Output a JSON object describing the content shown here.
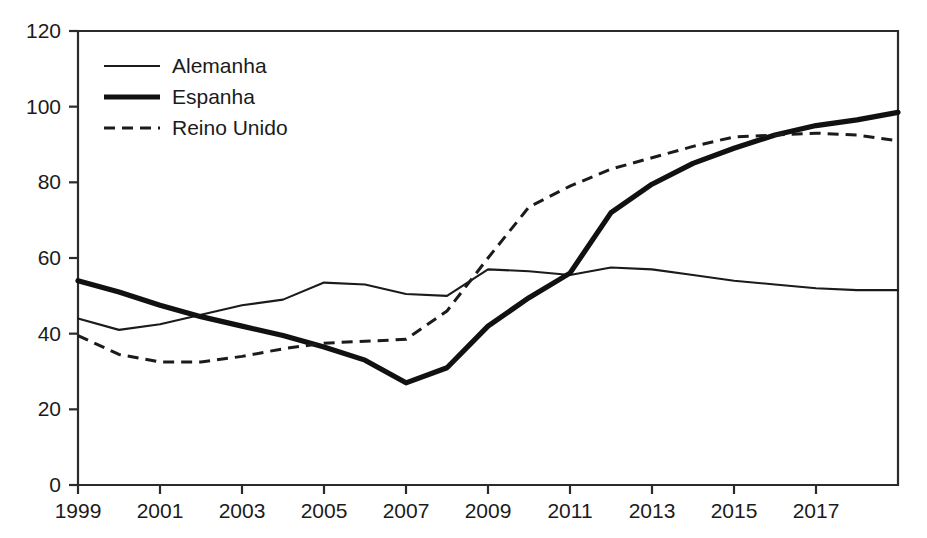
{
  "chart_data": {
    "type": "line",
    "title": "",
    "subtitle": "",
    "xlabel": "",
    "ylabel": "",
    "xlim": [
      1999,
      2019
    ],
    "ylim": [
      0,
      120
    ],
    "grid": false,
    "legend_position": "top-left",
    "x": [
      1999,
      2000,
      2001,
      2002,
      2003,
      2004,
      2005,
      2006,
      2007,
      2008,
      2009,
      2010,
      2011,
      2012,
      2013,
      2014,
      2015,
      2016,
      2017,
      2018,
      2019
    ],
    "xtick_labels": [
      "1999",
      "2001",
      "2003",
      "2005",
      "2007",
      "2009",
      "2011",
      "2013",
      "2015",
      "2017"
    ],
    "xtick_values": [
      1999,
      2001,
      2003,
      2005,
      2007,
      2009,
      2011,
      2013,
      2015,
      2017
    ],
    "ytick_labels": [
      "0",
      "20",
      "40",
      "60",
      "80",
      "100",
      "120"
    ],
    "ytick_values": [
      0,
      20,
      40,
      60,
      80,
      100,
      120
    ],
    "series": [
      {
        "name": "Alemanha",
        "style": "solid-thin",
        "color": "#1b1b1b",
        "values": [
          44,
          41,
          42.5,
          45,
          47.5,
          49,
          53.5,
          53,
          50.5,
          50,
          57,
          56.5,
          55.5,
          57.5,
          57,
          55.5,
          54,
          53,
          52,
          51.5,
          51.5
        ]
      },
      {
        "name": "Espanha",
        "style": "solid-thick",
        "color": "#111111",
        "values": [
          54,
          51,
          47.5,
          44.5,
          42,
          39.5,
          36.5,
          33,
          27,
          31,
          42,
          49.5,
          56,
          72,
          79.5,
          85,
          89,
          92.5,
          95,
          96.5,
          98.5
        ]
      },
      {
        "name": "Reino Unido",
        "style": "dashed",
        "color": "#1b1b1b",
        "values": [
          39.5,
          34.5,
          32.5,
          32.5,
          34,
          36,
          37.5,
          38,
          38.5,
          46,
          60,
          73.5,
          79,
          83.5,
          86.5,
          89.5,
          92,
          92.5,
          93,
          92.5,
          91
        ]
      }
    ]
  },
  "legend": {
    "items": [
      {
        "label": "Alemanha"
      },
      {
        "label": "Espanha"
      },
      {
        "label": "Reino Unido"
      }
    ]
  }
}
